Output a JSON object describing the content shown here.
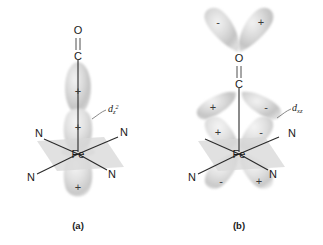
{
  "figure": {
    "panels": [
      {
        "id": "a",
        "caption": "(a)",
        "orbital_label": {
          "base": "d",
          "sub": "z",
          "sup": "2",
          "full": "dz2"
        },
        "metal_label": "Fe",
        "ligand_labels": [
          "N",
          "N",
          "N",
          "N"
        ],
        "co_labels": {
          "oxygen": "O",
          "carbon": "C"
        },
        "bond_type": "double",
        "lobe_signs": [
          "+",
          "+",
          "+"
        ],
        "description": "sigma donation from CO lone pair into metal dz2 orbital"
      },
      {
        "id": "b",
        "caption": "(b)",
        "orbital_label": {
          "base": "d",
          "sub": "xz",
          "sup": "",
          "full": "dxz"
        },
        "metal_label": "Fe",
        "ligand_labels": [
          "N",
          "N",
          "N",
          "N"
        ],
        "co_labels": {
          "oxygen": "O",
          "carbon": "C"
        },
        "bond_type": "double",
        "lobe_signs": [
          "-",
          "+",
          "+",
          "-",
          "+",
          "-",
          "-",
          "+"
        ],
        "description": "pi backbonding from metal dxz orbital into CO pi-star orbital"
      }
    ],
    "colors": {
      "background": "#ffffff",
      "lobe_fill": "#c9c9c9",
      "lobe_core": "#e8e8e8",
      "plane_fill": "#d8d8d8",
      "bond_stroke": "#2a2a2a",
      "text": "#1a1a1a",
      "leader": "#6a6a6a"
    }
  }
}
